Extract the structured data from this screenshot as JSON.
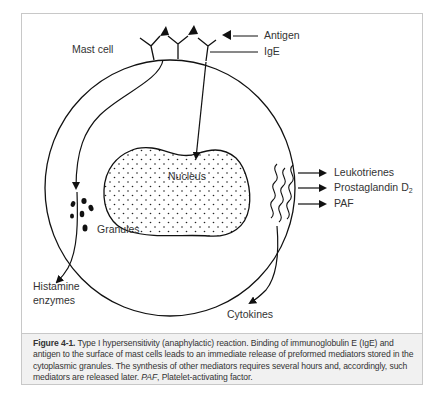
{
  "figure": {
    "labels": {
      "mast_cell": "Mast cell",
      "antigen": "Antigen",
      "ige": "IgE",
      "nucleus": "Nucleus",
      "granules": "Granules",
      "histamine_line1": "Histamine",
      "histamine_line2": "enzymes",
      "cytokines": "Cytokines",
      "leukotrienes": "Leukotrienes",
      "prostaglandin": "Prostaglandin D",
      "prostaglandin_sub": "2",
      "paf": "PAF"
    },
    "colors": {
      "line": "#111111",
      "text": "#333333",
      "caption_bg": "#f1f1f1",
      "border": "#c8c8c8"
    }
  },
  "caption": {
    "figure_label": "Figure 4-1.",
    "text_1": " Type I hypersensitivity (anaphylactic) reaction. Binding of immunoglobulin E (IgE) and antigen to the surface of mast cells leads to an immediate release of preformed mediators stored in the cytoplasmic granules. The synthesis of other mediators requires several hours and, accordingly, such mediators are released later. ",
    "abbr": "PAF",
    "text_2": ", Platelet-activating factor."
  }
}
